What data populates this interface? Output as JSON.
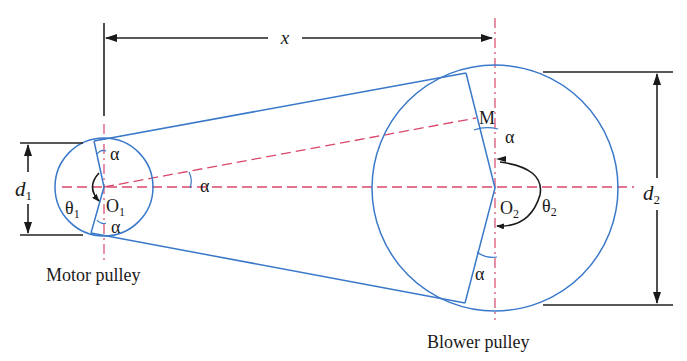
{
  "figure": {
    "dimensions": {
      "center_distance_label": "x",
      "motor_diameter_label": "d",
      "motor_diameter_sub": "1",
      "blower_diameter_label": "d",
      "blower_diameter_sub": "2"
    },
    "motor_pulley": {
      "caption": "Motor pulley",
      "center_label": "O",
      "center_sub": "1",
      "wrap_angle_label": "θ",
      "wrap_angle_sub": "1",
      "angle_top": "α",
      "angle_bottom": "α"
    },
    "blower_pulley": {
      "caption": "Blower pulley",
      "center_label": "O",
      "center_sub": "2",
      "wrap_angle_label": "θ",
      "wrap_angle_sub": "2",
      "point_label": "M",
      "angle_top": "α",
      "angle_bottom": "α"
    },
    "center_line_angle": "α",
    "colors": {
      "belt": "#3a78c9",
      "centerline": "#d9476a",
      "dimension": "#222222"
    }
  }
}
